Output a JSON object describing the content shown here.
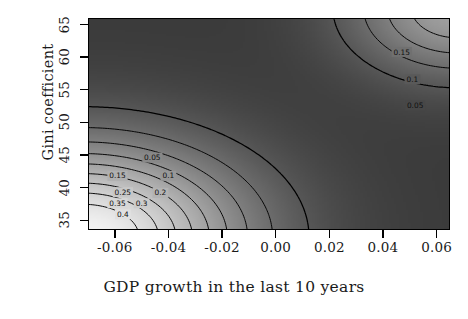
{
  "chart_data": {
    "type": "contour",
    "title": "",
    "xlabel": "GDP growth in the last 10 years",
    "ylabel": "Gini coefficient",
    "xlim": [
      -0.07,
      0.065
    ],
    "ylim": [
      33.5,
      66.0
    ],
    "xticks": [
      -0.06,
      -0.04,
      -0.02,
      0.0,
      0.02,
      0.04,
      0.06
    ],
    "xticklabels": [
      "-0.06",
      "-0.04",
      "-0.02",
      "0.00",
      "0.02",
      "0.04",
      "0.06"
    ],
    "yticks": [
      35,
      40,
      45,
      50,
      55,
      60,
      65
    ],
    "yticklabels": [
      "35",
      "40",
      "45",
      "50",
      "55",
      "60",
      "65"
    ],
    "grid": false,
    "legend": null,
    "zlabel": "density",
    "colormap": "grayscale-dark-to-light",
    "background_level": 0.0,
    "levels": [
      0.05,
      0.1,
      0.15,
      0.2,
      0.25,
      0.3,
      0.35,
      0.4,
      0.45
    ],
    "modes": [
      {
        "name": "lower-left-peak",
        "x": -0.072,
        "y": 32.5,
        "peak": 0.52,
        "sigma_x": 0.039,
        "sigma_y": 9.2
      },
      {
        "name": "upper-right-peak",
        "x": 0.068,
        "y": 67.5,
        "peak": 0.25,
        "sigma_x": 0.026,
        "sigma_y": 6.8
      }
    ],
    "contour_labels": [
      {
        "value": "0.05",
        "x": -0.046,
        "y": 44.6
      },
      {
        "value": "0.15",
        "x": -0.059,
        "y": 41.8
      },
      {
        "value": "0.1",
        "x": -0.04,
        "y": 41.8
      },
      {
        "value": "0.2",
        "x": -0.043,
        "y": 39.2
      },
      {
        "value": "0.25",
        "x": -0.057,
        "y": 39.3
      },
      {
        "value": "0.3",
        "x": -0.05,
        "y": 37.6
      },
      {
        "value": "0.35",
        "x": -0.059,
        "y": 37.6
      },
      {
        "value": "0.4",
        "x": -0.057,
        "y": 35.9
      },
      {
        "value": "0.05",
        "x": 0.052,
        "y": 52.6
      },
      {
        "value": "0.1",
        "x": 0.051,
        "y": 56.6
      },
      {
        "value": "0.15",
        "x": 0.047,
        "y": 60.8
      }
    ],
    "colors": {
      "plot_background": "#3a3a3a",
      "peak_high": "#f2f2f2",
      "contour_line": "#000000",
      "frame": "#000000",
      "text": "#1a1a1a",
      "page_background": "#ffffff"
    }
  }
}
